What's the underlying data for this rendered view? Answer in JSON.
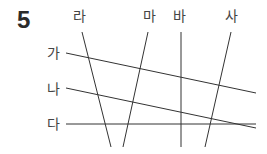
{
  "problem": {
    "number": "5"
  },
  "labels": {
    "ga": "가",
    "na": "나",
    "da": "다",
    "ra": "라",
    "ma": "마",
    "ba": "바",
    "sa": "사"
  },
  "colors": {
    "line": "#333333",
    "text": "#444444"
  },
  "lines": [
    {
      "name": "가",
      "x1": 66,
      "y1": 53,
      "x2": 256,
      "y2": 93
    },
    {
      "name": "나",
      "x1": 66,
      "y1": 88,
      "x2": 256,
      "y2": 128
    },
    {
      "name": "다",
      "x1": 66,
      "y1": 124,
      "x2": 256,
      "y2": 124
    },
    {
      "name": "라",
      "x1": 82,
      "y1": 32,
      "x2": 111,
      "y2": 147
    },
    {
      "name": "마",
      "x1": 148,
      "y1": 32,
      "x2": 123,
      "y2": 147
    },
    {
      "name": "바",
      "x1": 181,
      "y1": 32,
      "x2": 181,
      "y2": 147
    },
    {
      "name": "사",
      "x1": 231,
      "y1": 32,
      "x2": 205,
      "y2": 147
    }
  ]
}
